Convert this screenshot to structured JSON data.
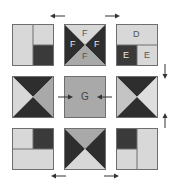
{
  "colors": {
    "light": "#d8d8d8",
    "medium": "#a9a9a9",
    "dark": "#3a3a3a",
    "border": "#6f6f6f",
    "label_on_light": "#555555",
    "label_on_dark": "#e6e6e6",
    "arrow": "#333333"
  },
  "tiles": {
    "top_left": {
      "description": "split tile: left half light, top-right light, bottom-right dark"
    },
    "top_center": {
      "description": "hourglass tile",
      "labels": {
        "top": "F",
        "left": "F",
        "right": "F",
        "bottom": "F"
      }
    },
    "top_right": {
      "description": "split tile",
      "labels": {
        "top": "D",
        "bottom_left": "E",
        "bottom_right": "E"
      }
    },
    "middle_left": {
      "description": "hourglass tile: top and bottom dark"
    },
    "center": {
      "description": "solid medium tile",
      "label": "G"
    },
    "middle_right": {
      "description": "hourglass tile: top and bottom dark"
    },
    "bottom_left": {
      "description": "split tile: top-left light, top-right dark, bottom half light"
    },
    "bottom_center": {
      "description": "hourglass tile: left and right dark"
    },
    "bottom_right": {
      "description": "split tile: top-left dark, bottom-left light, right half light"
    }
  },
  "arrows": {
    "top_left": "left",
    "top_right": "right",
    "right_upper": "down",
    "right_lower": "up",
    "bottom_left": "left",
    "bottom_right": "right",
    "into_center_from_left": "right",
    "into_center_from_right": "left"
  }
}
